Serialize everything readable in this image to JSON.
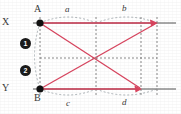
{
  "figure": {
    "background_color": "#ffffff",
    "colors": {
      "axis": "#8c8c8c",
      "point": "#111111",
      "ray": "#d9455f",
      "dashed": "#8a8a8a",
      "arc": "#9aa3a8",
      "text": "#3a3a3a",
      "badge_fill": "#1b1b1b",
      "badge_text": "#ffffff"
    },
    "axes": [
      {
        "name": "X",
        "label": "X",
        "y": 23,
        "x_start": 33,
        "x_end": 176
      },
      {
        "name": "Y",
        "label": "Y",
        "y": 89,
        "x_start": 33,
        "x_end": 176
      }
    ],
    "points": [
      {
        "id": "A",
        "label": "A",
        "x": 40,
        "y": 23,
        "label_x": 36,
        "label_y": 6
      },
      {
        "id": "B",
        "label": "B",
        "x": 40,
        "y": 89,
        "label_x": 36,
        "label_y": 93
      }
    ],
    "segment_labels": [
      {
        "id": "a",
        "label": "a",
        "x": 67,
        "y": 6
      },
      {
        "id": "b",
        "label": "b",
        "x": 123,
        "y": 5
      },
      {
        "id": "c",
        "label": "c",
        "x": 68,
        "y": 98
      },
      {
        "id": "d",
        "label": "d",
        "x": 123,
        "y": 97
      }
    ],
    "badges": [
      {
        "id": "1",
        "label": "1",
        "glyph": "❶",
        "x": 20,
        "y": 39
      },
      {
        "id": "2",
        "label": "2",
        "glyph": "❷",
        "x": 20,
        "y": 66
      }
    ],
    "vertical_guides": [
      40,
      96,
      141,
      157
    ],
    "horizontal_guide_y": 58,
    "rays": [
      {
        "name": "A-to-upper-right",
        "x1": 40,
        "y1": 23,
        "x2": 157,
        "y2": 23
      },
      {
        "name": "A-to-lower-right",
        "x1": 40,
        "y1": 23,
        "x2": 141,
        "y2": 89
      },
      {
        "name": "B-to-upper-right",
        "x1": 40,
        "y1": 89,
        "x2": 157,
        "y2": 23
      },
      {
        "name": "B-to-lower-right",
        "x1": 40,
        "y1": 89,
        "x2": 141,
        "y2": 89
      }
    ],
    "intersection": {
      "x": 96,
      "y": 58
    },
    "arcs": [
      {
        "id": "arc-a",
        "from_x": 40,
        "from_y": 23,
        "to_x": 96,
        "to_y": 23,
        "bulge": -12
      },
      {
        "id": "arc-b",
        "from_x": 96,
        "from_y": 23,
        "to_x": 157,
        "to_y": 23,
        "bulge": -12
      },
      {
        "id": "arc-c",
        "from_x": 40,
        "from_y": 89,
        "to_x": 96,
        "to_y": 89,
        "bulge": 12
      },
      {
        "id": "arc-d",
        "from_x": 96,
        "from_y": 89,
        "to_x": 157,
        "to_y": 89,
        "bulge": 12
      },
      {
        "id": "arc-left",
        "from_x": 40,
        "from_y": 23,
        "to_x": 40,
        "to_y": 89,
        "bulge": -11
      }
    ]
  }
}
